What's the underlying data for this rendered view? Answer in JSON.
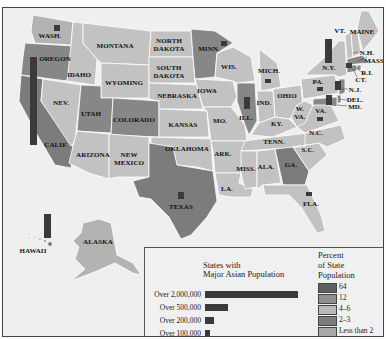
{
  "map": {
    "title": "States with Major Asian Population",
    "states": {
      "wash": "WASH.",
      "oregon": "OREGON",
      "calif": "CALIF.",
      "idaho": "IDAHO",
      "nev": "NEV.",
      "montana": "MONTANA",
      "wyoming": "WYOMING",
      "utah": "UTAH",
      "colorado": "COLORADO",
      "arizona": "ARIZONA",
      "new_mexico_1": "NEW",
      "new_mexico_2": "MEXICO",
      "north_dakota_1": "NORTH",
      "north_dakota_2": "DAKOTA",
      "south_dakota_1": "SOUTH",
      "south_dakota_2": "DAKOTA",
      "nebraska": "NEBRASKA",
      "kansas": "KANSAS",
      "oklahoma": "OKLAHOMA",
      "texas": "TEXAS",
      "minn": "MINN.",
      "iowa": "IOWA",
      "mo": "MO.",
      "ark": "ARK.",
      "la": "LA.",
      "wis": "WIS.",
      "ill": "ILL.",
      "mich": "MICH.",
      "ind": "IND.",
      "ohio": "OHIO",
      "ky": "KY.",
      "tenn": "TENN.",
      "miss": "MISS.",
      "ala": "ALA.",
      "ga": "GA.",
      "fla": "FLA.",
      "sc": "S.C.",
      "nc": "N.C.",
      "va": "VA.",
      "wva_1": "W.",
      "wva_2": "VA.",
      "pa": "PA.",
      "ny": "N.Y.",
      "vt": "VT.",
      "maine": "MAINE",
      "nh": "N.H.",
      "mass": "MASS.",
      "ri": "R.I.",
      "ct": "CT.",
      "nj": "N.J.",
      "del": "DEL.",
      "md": "MD.",
      "alaska": "ALASKA",
      "hawaii": "HAWAII"
    }
  },
  "legend": {
    "bars_title_line1": "States with",
    "bars_title_line2": "Major Asian Population",
    "bars": [
      {
        "label": "Over 2,000,000",
        "width": 93
      },
      {
        "label": "Over 500,000",
        "width": 23
      },
      {
        "label": "Over 200,000",
        "width": 9
      },
      {
        "label": "Over 100,000",
        "width": 5
      }
    ],
    "percent_title_line1": "Percent",
    "percent_title_line2": "of State",
    "percent_title_line3": "Population",
    "swatches": [
      {
        "label": "64",
        "color": "#5f5f5f"
      },
      {
        "label": "12",
        "color": "#8f8f8f"
      },
      {
        "label": "4–6",
        "color": "#b9b9b9"
      },
      {
        "label": "2–3",
        "color": "#7c7c7c"
      },
      {
        "label": "Less than 2",
        "color": "#a9a9a9"
      }
    ]
  },
  "colors": {
    "pct_64": "#5f5f5f",
    "pct_12": "#8f8f8f",
    "pct_4_6": "#c2c2c2",
    "pct_2_3": "#7f7f7f",
    "pct_lt2": "#b0b0b0",
    "bar": "#3a3a3a",
    "water": "#efefef"
  }
}
